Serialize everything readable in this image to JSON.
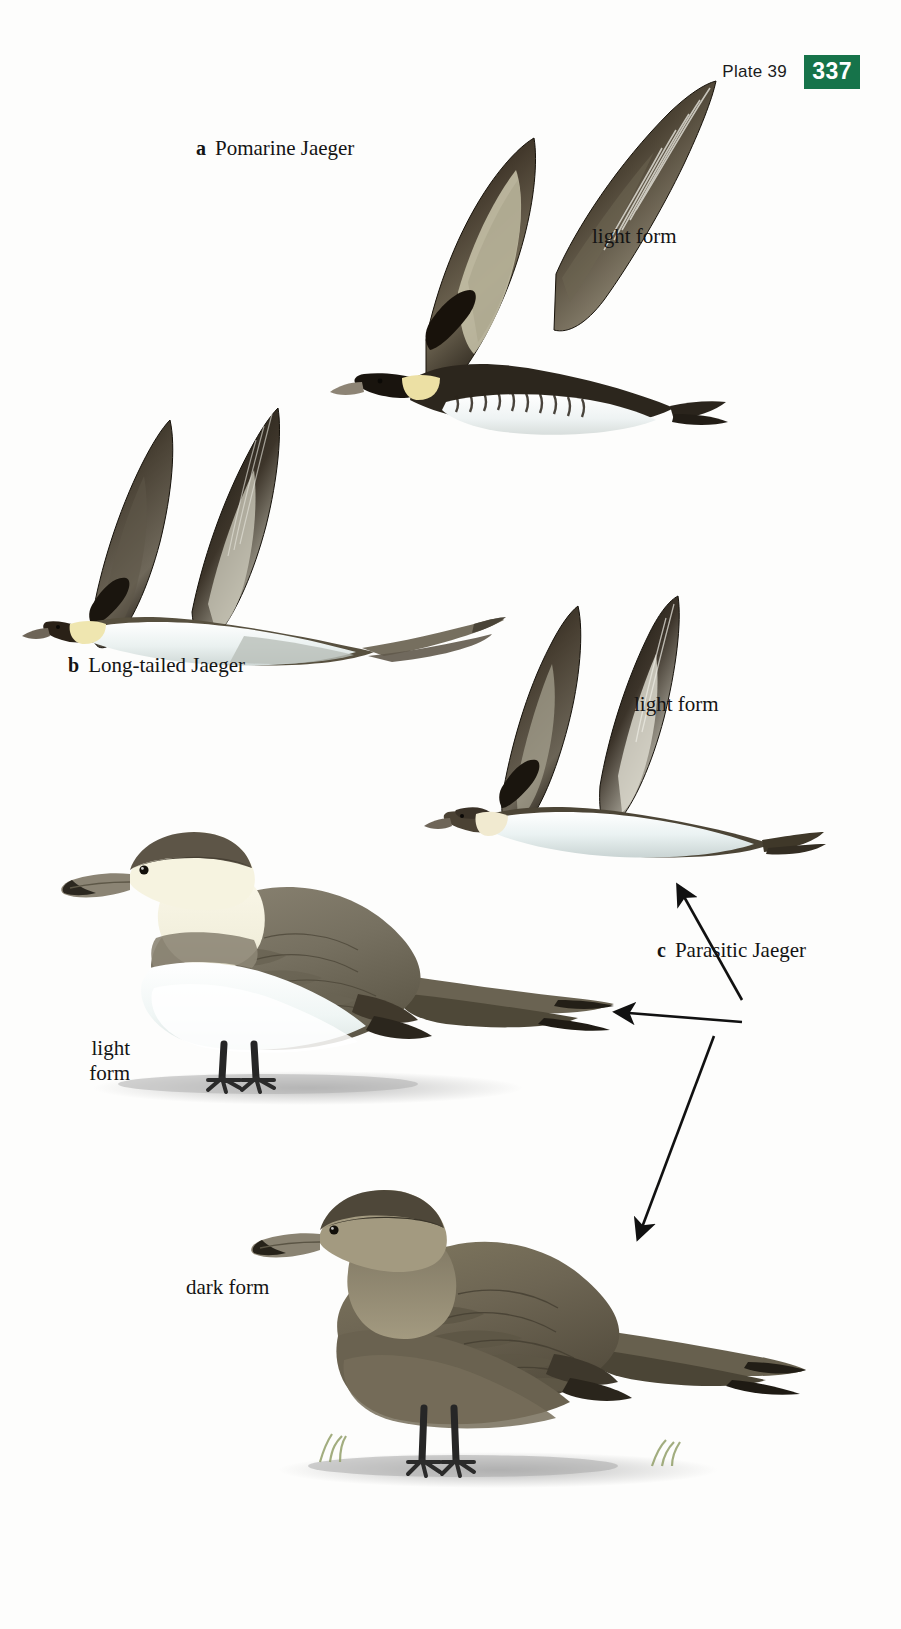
{
  "header": {
    "plate_label": "Plate 39",
    "page_number": "337",
    "badge_color": "#16734a",
    "badge_text_color": "#ffffff"
  },
  "labels": {
    "pomarine": {
      "key": "a",
      "text": "Pomarine Jaeger"
    },
    "light_form_1": {
      "text": "light form"
    },
    "longtailed": {
      "key": "b",
      "text": "Long-tailed Jaeger"
    },
    "light_form_2": {
      "text": "light form"
    },
    "parasitic": {
      "key": "c",
      "text": "Parasitic Jaeger"
    },
    "light_form_standing": {
      "line1": "light",
      "line2": "form"
    },
    "dark_form": {
      "text": "dark form"
    }
  },
  "illustrations": [
    {
      "name": "pomarine-jaeger-flight",
      "species": "Pomarine Jaeger",
      "morph": "light form",
      "pose": "flight",
      "palette": {
        "upperwing": "#3a332a",
        "wing_dark": "#241e18",
        "wing_pale": "#a8a18d",
        "underparts": "#f4f6f4",
        "neck_patch": "#ece0a4",
        "bill": "#8d8475"
      }
    },
    {
      "name": "long-tailed-jaeger-flight",
      "species": "Long-tailed Jaeger",
      "pose": "flight",
      "palette": {
        "upperwing": "#4a4338",
        "wing_dark": "#1f1a15",
        "wing_pale": "#b5b2a4",
        "underparts": "#eff3f1",
        "neck_patch": "#efe6b0",
        "tail_streamers": "#6e685a"
      }
    },
    {
      "name": "parasitic-jaeger-flight",
      "species": "Parasitic Jaeger",
      "morph": "light form",
      "pose": "flight",
      "palette": {
        "upperwing": "#3d362c",
        "wing_dark": "#201b15",
        "wing_pale": "#b9b5a5",
        "underparts": "#eef3f2",
        "neck_patch": "#efe9c6"
      }
    },
    {
      "name": "parasitic-jaeger-light-standing",
      "species": "Parasitic Jaeger",
      "morph": "light form",
      "pose": "standing",
      "palette": {
        "mantle": "#7a7261",
        "cap": "#5d5547",
        "throat": "#f6f3e0",
        "belly": "#f3f7f6",
        "legs": "#232323",
        "ground": "#c9c9c9"
      }
    },
    {
      "name": "parasitic-jaeger-dark-standing",
      "species": "Parasitic Jaeger",
      "morph": "dark form",
      "pose": "standing",
      "palette": {
        "body": "#6d6554",
        "cap": "#4e4739",
        "wing": "#5e5747",
        "legs": "#262626",
        "ground": "#c7c7c7",
        "grass": "#93a06a"
      }
    }
  ],
  "arrows": [
    {
      "name": "arrow-to-parasitic-flight",
      "from": [
        742,
        1000
      ],
      "to": [
        676,
        884
      ]
    },
    {
      "name": "arrow-to-parasitic-light",
      "from": [
        740,
        1022
      ],
      "to": [
        614,
        1012
      ]
    },
    {
      "name": "arrow-to-parasitic-dark",
      "from": [
        712,
        1036
      ],
      "to": [
        636,
        1240
      ]
    }
  ]
}
